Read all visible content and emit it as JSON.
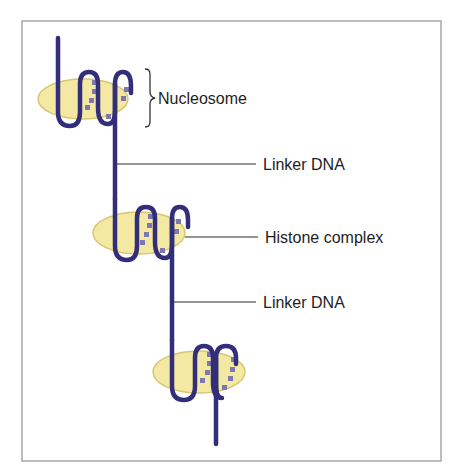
{
  "diagram": {
    "labels": {
      "nucleosome": "Nucleosome",
      "linker_dna_1": "Linker DNA",
      "histone_complex": "Histone complex",
      "linker_dna_2": "Linker DNA"
    },
    "colors": {
      "dna": "#332E7A",
      "histone_fill": "#F4E9A2",
      "histone_stroke": "#D8C66E",
      "dots": "#7E78B0",
      "frame": "#A8A8A8",
      "leader_line": "#2a2a2a",
      "text": "#1e1e1e"
    },
    "nucleosomes": [
      {
        "name": "nucleosome-1",
        "cx": 83,
        "cy": 98
      },
      {
        "name": "nucleosome-2",
        "cx": 140,
        "cy": 237
      },
      {
        "name": "nucleosome-3",
        "cx": 200,
        "cy": 374
      }
    ]
  }
}
